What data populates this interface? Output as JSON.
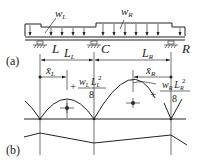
{
  "figure": {
    "panel_a_label": "(a)",
    "panel_b_label": "(b)",
    "loads": {
      "left": {
        "symbol": "w",
        "subscript": "L"
      },
      "right": {
        "symbol": "w",
        "subscript": "R"
      }
    },
    "supports": [
      {
        "name": "L",
        "label": "L"
      },
      {
        "name": "C",
        "label": "C"
      },
      {
        "name": "R",
        "label": "R"
      }
    ],
    "spans": {
      "left": {
        "symbol": "L",
        "subscript": "L"
      },
      "right": {
        "symbol": "L",
        "subscript": "R"
      }
    },
    "centroids": {
      "left": {
        "symbol": "x̄",
        "subscript": "L"
      },
      "right": {
        "symbol": "x̄",
        "subscript": "R"
      }
    },
    "moments": {
      "left": {
        "sign": "+",
        "numerator_w": "w",
        "numerator_w_sub": "L",
        "numerator_L": "L",
        "numerator_L_sub": "L",
        "exponent": "2",
        "denominator": "8"
      },
      "right": {
        "sign": "+",
        "numerator_w": "w",
        "numerator_w_sub": "R",
        "numerator_L": "L",
        "numerator_L_sub": "R",
        "exponent": "2",
        "denominator": "8"
      }
    }
  }
}
